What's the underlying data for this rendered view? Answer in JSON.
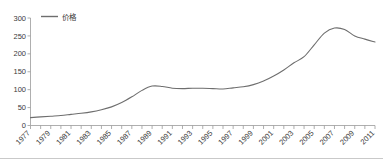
{
  "chart_data": {
    "type": "line",
    "title": "",
    "subtitle": "",
    "xlabel": "",
    "ylabel": "",
    "ylim": [
      0,
      300
    ],
    "xlim": [
      1977,
      2011
    ],
    "grid": false,
    "legend_position": "top-left",
    "y_ticks": [
      "0",
      "50",
      "100",
      "150",
      "200",
      "250",
      "300"
    ],
    "y_tick_values": [
      0,
      50,
      100,
      150,
      200,
      250,
      300
    ],
    "x_tick_labels": [
      "1977",
      "1979",
      "1981",
      "1983",
      "1985",
      "1987",
      "1989",
      "1991",
      "1993",
      "1995",
      "1997",
      "1999",
      "2001",
      "2003",
      "2005",
      "2007",
      "2009",
      "2011"
    ],
    "x_tick_values": [
      1977,
      1979,
      1981,
      1983,
      1985,
      1987,
      1989,
      1991,
      1993,
      1995,
      1997,
      1999,
      2001,
      2003,
      2005,
      2007,
      2009,
      2011
    ],
    "series": [
      {
        "name": "价格",
        "color": "#6e6e6e",
        "x": [
          1977,
          1978,
          1979,
          1980,
          1981,
          1982,
          1983,
          1984,
          1985,
          1986,
          1987,
          1988,
          1989,
          1990,
          1991,
          1992,
          1993,
          1994,
          1995,
          1996,
          1997,
          1998,
          1999,
          2000,
          2001,
          2002,
          2003,
          2004,
          2005,
          2006,
          2007,
          2008,
          2009,
          2010,
          2011
        ],
        "values": [
          22,
          24,
          26,
          28,
          31,
          34,
          38,
          44,
          52,
          64,
          80,
          98,
          110,
          109,
          104,
          103,
          104,
          104,
          103,
          102,
          105,
          108,
          114,
          124,
          138,
          155,
          175,
          192,
          225,
          258,
          272,
          268,
          250,
          241,
          233
        ]
      }
    ]
  },
  "legend": {
    "entries": [
      {
        "label": "价格",
        "color": "#6e6e6e"
      }
    ]
  },
  "axes": {
    "y_axis_name": "y-axis",
    "x_axis_name": "x-axis"
  }
}
